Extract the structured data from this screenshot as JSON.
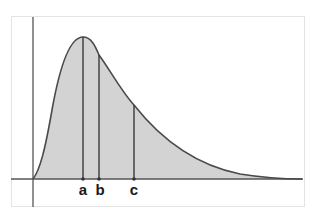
{
  "diagram": {
    "type": "right-skewed distribution curve",
    "colors": {
      "background": "#ffffff",
      "frame": "#e4e4e4",
      "fill": "#d3d3d3",
      "curve": "#4a4a4a",
      "axes": "#555555",
      "markers": "#3a3a3a",
      "labels": "#1a1a1a"
    },
    "markers": [
      {
        "id": "a",
        "label": "a",
        "x": 83,
        "top": 37
      },
      {
        "id": "b",
        "label": "b",
        "x": 99,
        "top": 55
      },
      {
        "id": "c",
        "label": "c",
        "x": 134,
        "top": 105
      }
    ]
  }
}
